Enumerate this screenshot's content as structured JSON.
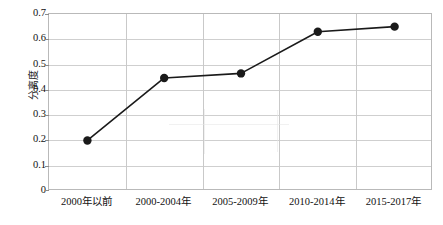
{
  "chart_data": {
    "type": "line",
    "title": "",
    "xlabel": "",
    "ylabel": "分离度",
    "categories": [
      "2000年以前",
      "2000-2004年",
      "2005-2009年",
      "2010-2014年",
      "2015-2017年"
    ],
    "values": [
      0.2,
      0.447,
      0.465,
      0.63,
      0.65
    ],
    "ylim": [
      0,
      0.7
    ],
    "y_ticks": [
      "0",
      "0.1",
      "0.2",
      "0.3",
      "0.4",
      "0.5",
      "0.6",
      "0.7"
    ],
    "y_tick_values": [
      0,
      0.1,
      0.2,
      0.3,
      0.4,
      0.5,
      0.6,
      0.7
    ],
    "grid": true,
    "legend": "none",
    "series": [
      {
        "name": "分离度",
        "values": [
          0.2,
          0.447,
          0.465,
          0.63,
          0.65
        ],
        "line_color": "#1a1a1a",
        "marker_color": "#1a1a1a",
        "marker": "circle"
      }
    ],
    "colors": {
      "line": "#1a1a1a",
      "marker": "#1a1a1a",
      "grid": "#cfcfcf",
      "frame": "#b9b9b9",
      "background": "#ffffff",
      "text": "#111111"
    }
  }
}
